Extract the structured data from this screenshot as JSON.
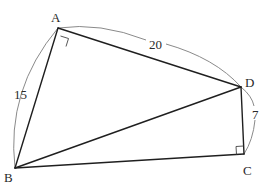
{
  "diagram": {
    "type": "geometry",
    "vertices": [
      {
        "label": "A",
        "x": 58,
        "y": 28
      },
      {
        "label": "D",
        "x": 241,
        "y": 87
      },
      {
        "label": "C",
        "x": 244,
        "y": 154
      },
      {
        "label": "B",
        "x": 15,
        "y": 168
      }
    ],
    "segments": [
      {
        "from": "A",
        "to": "B"
      },
      {
        "from": "A",
        "to": "D"
      },
      {
        "from": "D",
        "to": "C"
      },
      {
        "from": "C",
        "to": "B"
      },
      {
        "from": "B",
        "to": "D"
      }
    ],
    "right_angles": [
      "A",
      "C"
    ],
    "measurements": [
      {
        "segment": "AB",
        "label": "15"
      },
      {
        "segment": "AD",
        "label": "20"
      },
      {
        "segment": "DC",
        "label": "7"
      }
    ],
    "labels": {
      "A": "A",
      "B": "B",
      "C": "C",
      "D": "D",
      "AB": "15",
      "AD": "20",
      "DC": "7"
    }
  }
}
